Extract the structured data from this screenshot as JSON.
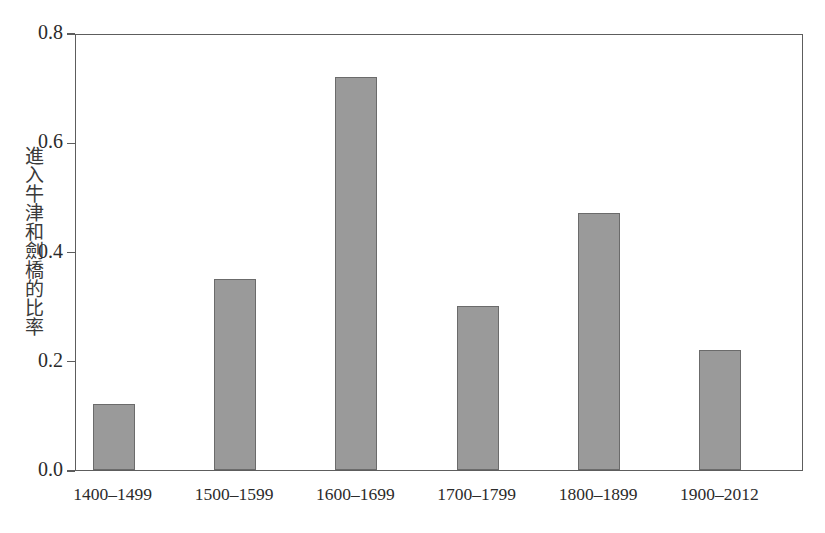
{
  "chart_data": {
    "type": "bar",
    "title": "",
    "subtitle": "",
    "xlabel": "",
    "ylabel": "進入牛津和劍橋的比率",
    "categories": [
      "1400–1499",
      "1500–1599",
      "1600–1699",
      "1700–1799",
      "1800–1899",
      "1900–2012"
    ],
    "values": [
      0.12,
      0.35,
      0.72,
      0.3,
      0.47,
      0.22
    ],
    "ylim": [
      0.0,
      0.8
    ],
    "yticks": [
      0.0,
      0.2,
      0.4,
      0.6,
      0.8
    ],
    "ytick_labels": [
      "0.0",
      "0.2",
      "0.4",
      "0.6",
      "0.8"
    ],
    "grid": false,
    "legend": null,
    "legend_position": "none",
    "bar_color": "#9a9a9a",
    "bar_edge_color": "#6b6b6b",
    "axis_color": "#5d5d5d",
    "background_color": "#ffffff"
  }
}
